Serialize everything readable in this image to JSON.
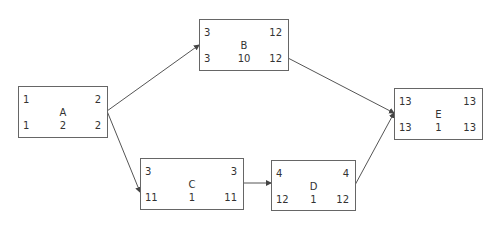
{
  "diagram": {
    "type": "activity-on-node network",
    "nodes": [
      {
        "id": "A",
        "top_left": "1",
        "top_right": "2",
        "name": "A",
        "bottom_left": "1",
        "bottom_mid": "2",
        "bottom_right": "2"
      },
      {
        "id": "B",
        "top_left": "3",
        "top_right": "12",
        "name": "B",
        "bottom_left": "3",
        "bottom_mid": "10",
        "bottom_right": "12"
      },
      {
        "id": "C",
        "top_left": "3",
        "top_right": "3",
        "name": "C",
        "bottom_left": "11",
        "bottom_mid": "1",
        "bottom_right": "11"
      },
      {
        "id": "D",
        "top_left": "4",
        "top_right": "4",
        "name": "D",
        "bottom_left": "12",
        "bottom_mid": "1",
        "bottom_right": "12"
      },
      {
        "id": "E",
        "top_left": "13",
        "top_right": "13",
        "name": "E",
        "bottom_left": "13",
        "bottom_mid": "1",
        "bottom_right": "13"
      }
    ],
    "edges": [
      {
        "from": "A",
        "to": "B"
      },
      {
        "from": "A",
        "to": "C"
      },
      {
        "from": "C",
        "to": "D"
      },
      {
        "from": "B",
        "to": "E"
      },
      {
        "from": "D",
        "to": "E"
      }
    ],
    "colors": {
      "line": "#555555",
      "border": "#666666",
      "text": "#333333"
    }
  }
}
